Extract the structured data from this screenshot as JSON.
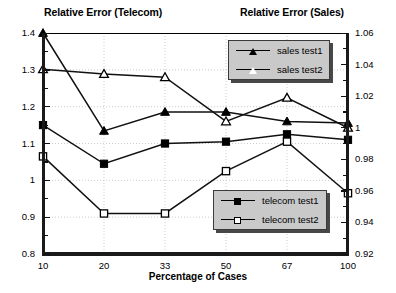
{
  "titles": {
    "left": "Relative Error (Telecom)",
    "right": "Relative Error (Sales)"
  },
  "axes": {
    "xlabel": "Percentage of Cases",
    "x_ticks": [
      "10",
      "20",
      "33",
      "50",
      "67",
      "100"
    ],
    "left_ticks": [
      "1.4",
      "1.3",
      "1.2",
      "1.1",
      "1",
      "0.9",
      "0.8"
    ],
    "right_ticks": [
      "1.06",
      "1.04",
      "1.02",
      "1",
      "0.98",
      "0.96",
      "0.94",
      "0.92"
    ]
  },
  "legends": {
    "sales": [
      {
        "label": "sales test1",
        "marker": "triangle-filled"
      },
      {
        "label": "sales test2",
        "marker": "triangle-open"
      }
    ],
    "telecom": [
      {
        "label": "telecom test1",
        "marker": "square-filled"
      },
      {
        "label": "telecom test2",
        "marker": "square-open"
      }
    ]
  },
  "chart_data": {
    "type": "line",
    "xlabel": "Percentage of Cases",
    "ylabel": "Relative Error (Telecom)",
    "y2label": "Relative Error (Sales)",
    "categories": [
      "10",
      "20",
      "33",
      "50",
      "67",
      "100"
    ],
    "ylim": [
      0.8,
      1.4
    ],
    "y2lim": [
      0.92,
      1.06
    ],
    "grid": true,
    "legend_position": "inside-right",
    "series": [
      {
        "name": "sales test1",
        "axis": "right",
        "marker": "triangle-filled",
        "values": [
          1.06,
          0.998,
          1.01,
          1.01,
          1.004,
          1.003
        ],
        "left_scale_equivalent": [
          1.4,
          1.135,
          1.185,
          1.185,
          1.155,
          1.15
        ]
      },
      {
        "name": "sales test2",
        "axis": "right",
        "marker": "triangle-open",
        "values": [
          1.037,
          1.034,
          1.032,
          1.004,
          1.019,
          1.0
        ],
        "left_scale_equivalent": [
          1.3,
          1.285,
          1.275,
          1.155,
          1.22,
          1.145
        ]
      },
      {
        "name": "telecom test1",
        "axis": "left",
        "marker": "square-filled",
        "values": [
          1.15,
          1.045,
          1.1,
          1.105,
          1.125,
          1.11
        ]
      },
      {
        "name": "telecom test2",
        "axis": "left",
        "marker": "square-open",
        "values": [
          1.065,
          0.91,
          0.91,
          1.025,
          1.105,
          0.965
        ]
      }
    ]
  }
}
